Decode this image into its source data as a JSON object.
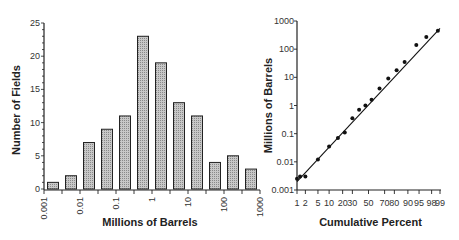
{
  "chart_data": [
    {
      "type": "bar",
      "title": "",
      "xlabel": "Millions of Barrels",
      "ylabel": "Number of Fields",
      "x_scale": "log",
      "x_tick_labels": [
        "0.001",
        "0.01",
        "0.1",
        "1",
        "10",
        "100",
        "1000"
      ],
      "y_tick_labels": [
        "0",
        "5",
        "10",
        "15",
        "20",
        "25"
      ],
      "ylim": [
        0,
        25
      ],
      "xlim": [
        0.001,
        1000
      ],
      "grid": false,
      "categories": [
        "0.001-0.003",
        "0.003-0.01",
        "0.01-0.03",
        "0.03-0.1",
        "0.1-0.3",
        "0.3-1",
        "1-3",
        "3-10",
        "10-30",
        "30-100",
        "100-300",
        "300-1000"
      ],
      "values": [
        1,
        2,
        7,
        9,
        11,
        23,
        19,
        13,
        11,
        4,
        5,
        3
      ],
      "bar_fill": "#b8b8b8"
    },
    {
      "type": "scatter",
      "title": "",
      "xlabel": "Cumulative Percent",
      "ylabel": "Millions of Barrels",
      "x_scale": "probability",
      "y_scale": "log",
      "x_tick_labels": [
        "1",
        "2",
        "5",
        "10",
        "20",
        "30",
        "50",
        "70",
        "80",
        "90",
        "95",
        "98",
        "99"
      ],
      "y_tick_labels": [
        "0.001",
        "0.01",
        "0.1",
        "1",
        "10",
        "100",
        "1000"
      ],
      "ylim": [
        0.001,
        1000
      ],
      "grid": false,
      "legend": "none",
      "series": [
        {
          "name": "fields",
          "x": [
            1,
            1.3,
            2,
            5,
            10,
            16,
            22,
            30,
            38,
            46,
            54,
            64,
            74,
            82,
            88,
            94,
            97,
            98.8
          ],
          "y": [
            0.0025,
            0.003,
            0.003,
            0.012,
            0.035,
            0.07,
            0.11,
            0.35,
            0.7,
            1.0,
            1.6,
            4,
            9,
            18,
            35,
            140,
            270,
            450
          ]
        },
        {
          "name": "fit-line",
          "x": [
            1,
            99
          ],
          "y": [
            0.002,
            550
          ]
        }
      ]
    }
  ]
}
